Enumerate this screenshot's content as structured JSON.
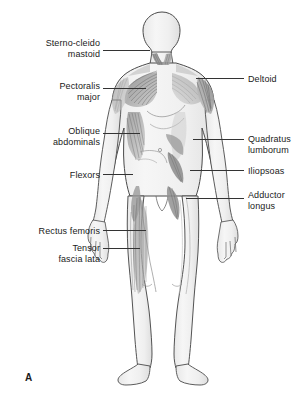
{
  "figure": {
    "panel_letter": "A",
    "view": "anterior-muscle-overview",
    "background_color": "#ffffff",
    "line_color": "#333333",
    "text_color": "#1a1a1a",
    "body_fill": "#f2f2f2",
    "muscle_fill": "#9a9a9a"
  },
  "labels_left": [
    {
      "id": "sterno-cleido-mastoid",
      "lines": [
        "Sterno-cleido",
        "mastoid"
      ],
      "text": "Sterno-cleido\nmastoid",
      "text_x": 100,
      "text_y": 38,
      "leader": {
        "x1": 103,
        "y1": 50,
        "x2": 150,
        "y2": 50
      }
    },
    {
      "id": "pectoralis-major",
      "lines": [
        "Pectoralis",
        "major"
      ],
      "text": "Pectoralis\nmajor",
      "text_x": 100,
      "text_y": 81,
      "leader": {
        "x1": 103,
        "y1": 88,
        "x2": 146,
        "y2": 88
      }
    },
    {
      "id": "oblique-abdominals",
      "lines": [
        "Oblique",
        "abdominals"
      ],
      "text": "Oblique\nabdominals",
      "text_x": 100,
      "text_y": 126,
      "leader": {
        "x1": 103,
        "y1": 133,
        "x2": 140,
        "y2": 133
      }
    },
    {
      "id": "flexors",
      "lines": [
        "Flexors"
      ],
      "text": "Flexors",
      "text_x": 100,
      "text_y": 170,
      "leader": {
        "x1": 103,
        "y1": 174,
        "x2": 133,
        "y2": 174
      }
    },
    {
      "id": "rectus-femoris",
      "lines": [
        "Rectus femoris"
      ],
      "text": "Rectus femoris",
      "text_x": 100,
      "text_y": 226,
      "leader": {
        "x1": 103,
        "y1": 230,
        "x2": 146,
        "y2": 230
      }
    },
    {
      "id": "tensor-fascia-lata",
      "lines": [
        "Tensor",
        "fascia lata"
      ],
      "text": "Tensor\nfascia lata",
      "text_x": 100,
      "text_y": 243,
      "leader": {
        "x1": 103,
        "y1": 248,
        "x2": 140,
        "y2": 248
      }
    }
  ],
  "labels_right": [
    {
      "id": "deltoid",
      "lines": [
        "Deltoid"
      ],
      "text": "Deltoid",
      "text_x": 248,
      "text_y": 74,
      "leader": {
        "x1": 196,
        "y1": 78,
        "x2": 244,
        "y2": 78
      }
    },
    {
      "id": "quadratus-lumborum",
      "lines": [
        "Quadratus",
        "lumborum"
      ],
      "text": "Quadratus\nlumborum",
      "text_x": 248,
      "text_y": 134,
      "leader": {
        "x1": 193,
        "y1": 139,
        "x2": 244,
        "y2": 139
      }
    },
    {
      "id": "iliopsoas",
      "lines": [
        "Iliopsoas"
      ],
      "text": "Iliopsoas",
      "text_x": 248,
      "text_y": 166,
      "leader": {
        "x1": 190,
        "y1": 170,
        "x2": 244,
        "y2": 170
      }
    },
    {
      "id": "adductor-longus",
      "lines": [
        "Adductor",
        "longus"
      ],
      "text": "Adductor\nlongus",
      "text_x": 248,
      "text_y": 190,
      "leader": {
        "x1": 186,
        "y1": 198,
        "x2": 244,
        "y2": 198
      }
    }
  ]
}
